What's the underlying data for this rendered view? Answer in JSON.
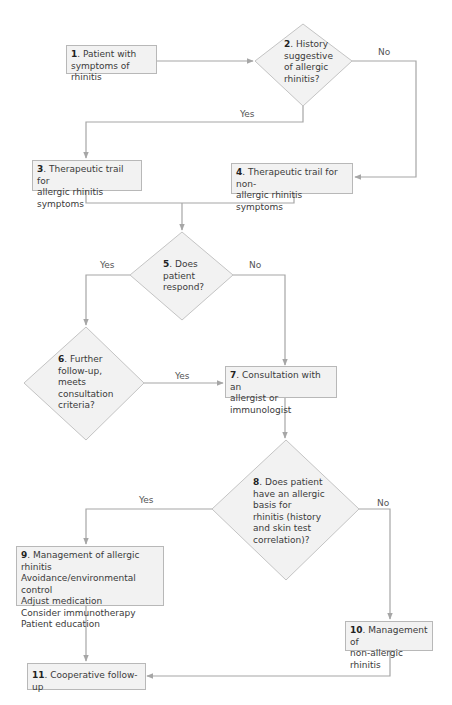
{
  "diagram": {
    "type": "flowchart",
    "colors": {
      "node_fill": "#f2f2f2",
      "node_border": "#b8b8b8",
      "connector": "#a6a6a6",
      "text": "#3a3a3a"
    },
    "nodes": [
      {
        "id": "1",
        "shape": "box",
        "number": "1",
        "lines": [
          ". Patient with",
          "symptoms of rhinitis"
        ]
      },
      {
        "id": "2",
        "shape": "diamond",
        "number": "2",
        "lines": [
          ". History",
          "suggestive",
          "of allergic",
          "rhinitis?"
        ]
      },
      {
        "id": "3",
        "shape": "box",
        "number": "3",
        "lines": [
          ". Therapeutic trail for",
          "allergic rhinitis symptoms"
        ]
      },
      {
        "id": "4",
        "shape": "box",
        "number": "4",
        "lines": [
          ". Therapeutic trail for non-",
          "allergic rhinitis symptoms"
        ]
      },
      {
        "id": "5",
        "shape": "diamond",
        "number": "5",
        "lines": [
          ". Does",
          "patient",
          "respond?"
        ]
      },
      {
        "id": "6",
        "shape": "diamond",
        "number": "6",
        "lines": [
          ". Further",
          "follow-up,",
          "meets",
          "consultation",
          "criteria?"
        ]
      },
      {
        "id": "7",
        "shape": "box",
        "number": "7",
        "lines": [
          ". Consultation with an",
          "allergist or immunologist"
        ]
      },
      {
        "id": "8",
        "shape": "diamond",
        "number": "8",
        "lines": [
          ". Does patient",
          "have an allergic",
          "basis for",
          "rhinitis (history",
          "and skin test",
          "correlation)?"
        ]
      },
      {
        "id": "9",
        "shape": "box",
        "number": "9",
        "lines": [
          ". Management of allergic rhinitis",
          "Avoidance/environmental control",
          "Adjust medication",
          "Consider immunotherapy",
          "Patient education"
        ]
      },
      {
        "id": "10",
        "shape": "box",
        "number": "10",
        "lines": [
          ". Management of",
          "non-allergic rhinitis"
        ]
      },
      {
        "id": "11",
        "shape": "box",
        "number": "11",
        "lines": [
          ". Cooperative follow-up"
        ]
      }
    ],
    "edges": [
      {
        "from": "1",
        "to": "2",
        "label": ""
      },
      {
        "from": "2",
        "to": "3",
        "label": "Yes"
      },
      {
        "from": "2",
        "to": "4",
        "label": "No"
      },
      {
        "from": "3",
        "to": "5",
        "label": ""
      },
      {
        "from": "4",
        "to": "5",
        "label": ""
      },
      {
        "from": "5",
        "to": "6",
        "label": "Yes"
      },
      {
        "from": "5",
        "to": "7",
        "label": "No"
      },
      {
        "from": "6",
        "to": "7",
        "label": "Yes"
      },
      {
        "from": "7",
        "to": "8",
        "label": ""
      },
      {
        "from": "8",
        "to": "9",
        "label": "Yes"
      },
      {
        "from": "8",
        "to": "10",
        "label": "No"
      },
      {
        "from": "9",
        "to": "11",
        "label": ""
      },
      {
        "from": "10",
        "to": "11",
        "label": ""
      }
    ],
    "labels": {
      "yes": "Yes",
      "no": "No"
    }
  }
}
